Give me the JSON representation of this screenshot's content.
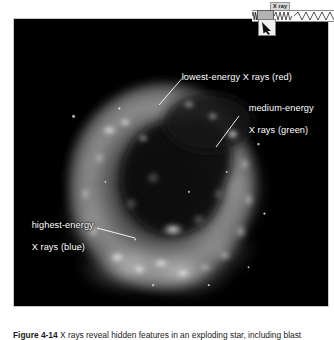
{
  "figure": {
    "alt_description": "Chandra X-ray Observatory image of a supernova remnant shell, color-coded by X-ray energy",
    "caption": {
      "number": "Figure 4-14",
      "text": "X rays reveal hidden features in an exploding star, including blast"
    }
  },
  "annotations": [
    {
      "id": "lowest-energy",
      "text": "lowest-energy X rays (red)",
      "color": "#ffffff"
    },
    {
      "id": "medium-energy",
      "line1": "medium-energy",
      "line2": "X rays (green)",
      "color": "#ffffff"
    },
    {
      "id": "highest-energy",
      "line1": "highest-energy",
      "line2": "X rays (blue)",
      "color": "#ffffff"
    }
  ],
  "spectrum_widget": {
    "label": "X ray",
    "name": "electromagnetic-spectrum-indicator",
    "marker_position": "x-ray-band"
  },
  "colors": {
    "plate_background": "#000000",
    "plate_border": "#c9c9c9",
    "page_background": "#ffffff",
    "annotation_text": "#ffffff",
    "caption_text": "#1a1a1a"
  }
}
